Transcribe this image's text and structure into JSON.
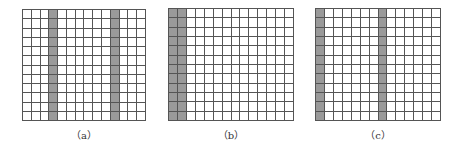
{
  "figure": {
    "rows": 12,
    "cols": 14,
    "colors": {
      "shaded": "#9a9a9a",
      "empty": "#ffffff",
      "line": "#555555"
    },
    "panels": [
      {
        "id": "a",
        "label": "（a）",
        "shaded_columns": [
          4,
          11
        ],
        "x": 22,
        "y": 9,
        "width": 124,
        "height": 112
      },
      {
        "id": "b",
        "label": "（b）",
        "shaded_columns": [
          1,
          2
        ],
        "x": 168,
        "y": 8,
        "width": 126,
        "height": 113
      },
      {
        "id": "c",
        "label": "（c）",
        "shaded_columns": [
          1,
          8
        ],
        "x": 315,
        "y": 8,
        "width": 126,
        "height": 113
      }
    ]
  }
}
